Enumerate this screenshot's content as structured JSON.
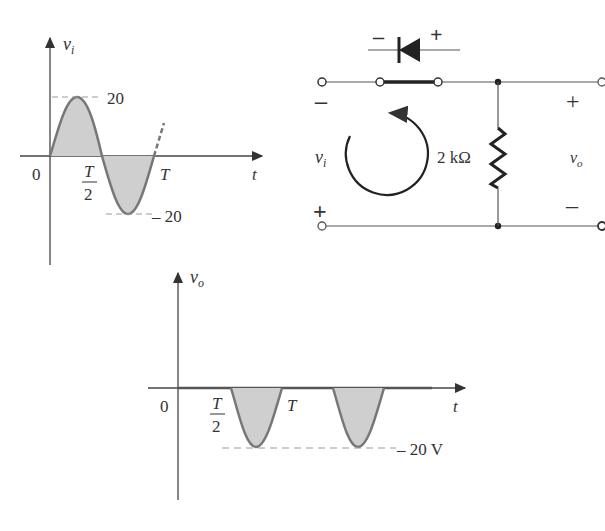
{
  "input_graph": {
    "y_label": "v",
    "y_sub": "i",
    "x_label": "t",
    "origin": "0",
    "peak_label": "20",
    "trough_label": "– 20",
    "half_period_num": "T",
    "half_period_den": "2",
    "period_label": "T"
  },
  "circuit": {
    "diode_minus": "–",
    "diode_plus": "+",
    "input_minus": "–",
    "input_plus": "+",
    "input_label": "v",
    "input_sub": "i",
    "resistor_label": "2 kΩ",
    "output_plus": "+",
    "output_minus": "–",
    "output_label": "v",
    "output_sub": "o"
  },
  "output_graph": {
    "y_label": "v",
    "y_sub": "o",
    "x_label": "t",
    "origin": "0",
    "half_period_num": "T",
    "half_period_den": "2",
    "period_label": "T",
    "trough_label": "– 20 V"
  },
  "colors": {
    "wave": "#777777",
    "fill": "#cccccc",
    "line": "#444444",
    "dash": "#999999"
  }
}
